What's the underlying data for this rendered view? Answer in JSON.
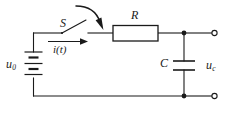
{
  "figure": {
    "kind": "circuit-diagram",
    "background_color": "#ffffff",
    "line_color": "#1a1a1a"
  },
  "labels": {
    "source": {
      "symbol": "u",
      "subscript": "0",
      "full": "u0",
      "name": "dc-source-voltage"
    },
    "current": {
      "full": "i(t)",
      "name": "branch-current"
    },
    "switch": {
      "full": "S",
      "name": "switch-designator"
    },
    "resistor": {
      "full": "R",
      "name": "resistor-designator"
    },
    "capacitor": {
      "full": "C",
      "name": "capacitor-designator"
    },
    "output": {
      "symbol": "u",
      "subscript": "c",
      "full": "uc",
      "name": "capacitor-voltage"
    }
  },
  "components": [
    {
      "id": "battery",
      "type": "dc-voltage-source",
      "label": "u0",
      "cells": 2
    },
    {
      "id": "switch",
      "type": "spst-switch",
      "label": "S",
      "state": "open"
    },
    {
      "id": "resistor",
      "type": "resistor",
      "label": "R",
      "style": "iec-box"
    },
    {
      "id": "capacitor",
      "type": "capacitor",
      "label": "C",
      "style": "parallel-plate"
    }
  ],
  "annotations": [
    {
      "id": "current-arrow",
      "type": "arrow",
      "direction": "right",
      "label": "i(t)"
    },
    {
      "id": "switch-pointer",
      "type": "curved-arrow",
      "direction": "down-right",
      "target": "switch"
    }
  ],
  "terminals": [
    {
      "id": "terminal-top",
      "marker": "open-circle",
      "position": "right-top"
    },
    {
      "id": "terminal-bottom",
      "marker": "open-circle",
      "position": "right-bottom"
    }
  ],
  "junctions": [
    {
      "id": "node-top-right",
      "marker": "solid-dot"
    },
    {
      "id": "node-bottom-right",
      "marker": "solid-dot"
    }
  ]
}
